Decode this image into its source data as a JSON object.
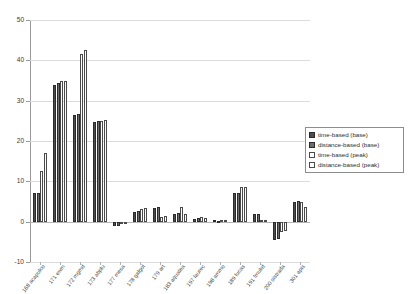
{
  "chart_data": {
    "type": "bar",
    "title": "",
    "subtitle": "",
    "xlabel": "",
    "ylabel": "",
    "ylim": [
      -10,
      50
    ],
    "yticks": [
      50,
      40,
      30,
      20,
      10,
      0,
      -10
    ],
    "ytick_labels": [
      "50",
      "40",
      "30",
      "20",
      "10",
      "0",
      "-10"
    ],
    "grid": true,
    "grid_axis": "y",
    "legend_position": "right",
    "categories": [
      "168 acapulco",
      "171 ewm",
      "172 mgmd",
      "173 abplu",
      "177 mesa",
      "178 galgol",
      "179 art",
      "183 aquatea",
      "197 laurec",
      "198 ammo",
      "189 lucas",
      "191 fmukd",
      "200 sistrada",
      "301 apis"
    ],
    "series": [
      {
        "name": "time-based (base)",
        "color": "#4c4c4c",
        "values": [
          7.0,
          34.0,
          26.5,
          24.8,
          -1.0,
          2.3,
          3.5,
          2.0,
          0.7,
          0.3,
          7.0,
          1.8,
          -4.5,
          5.0
        ]
      },
      {
        "name": "distance-based (base)",
        "color": "#6e6e6e",
        "values": [
          7.2,
          34.5,
          26.6,
          24.9,
          -1.2,
          2.6,
          3.7,
          2.2,
          0.8,
          0.2,
          7.2,
          1.9,
          -4.3,
          5.1
        ]
      },
      {
        "name": "time-based (peak)",
        "color": "#ffffff",
        "values": [
          12.5,
          34.8,
          41.5,
          25.0,
          -0.4,
          3.2,
          1.2,
          3.6,
          1.1,
          0.5,
          8.5,
          0.4,
          -2.6,
          5.0
        ]
      },
      {
        "name": "distance-based (peak)",
        "color": "#ffffff",
        "values": [
          17.0,
          34.9,
          42.5,
          25.3,
          -0.3,
          3.4,
          1.3,
          2.0,
          1.0,
          0.4,
          8.6,
          0.3,
          -2.4,
          3.6
        ]
      }
    ]
  },
  "legend": {
    "items": [
      {
        "label": "time-based (base)",
        "swatch": "s0"
      },
      {
        "label": "distance-based (base)",
        "swatch": "s1"
      },
      {
        "label": "time-based (peak)",
        "swatch": "s2"
      },
      {
        "label": "distance-based (peak)",
        "swatch": "s3"
      }
    ]
  }
}
